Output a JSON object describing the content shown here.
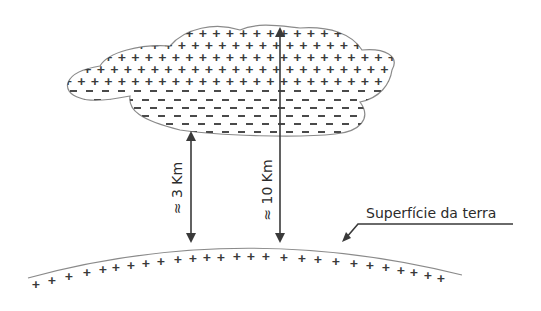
{
  "diagram": {
    "cloud": {
      "upper_charge": "+",
      "lower_charge": "−"
    },
    "ground": {
      "charge": "+",
      "label": "Superfície da terra"
    },
    "arrows": [
      {
        "label": "≈ 3 Km"
      },
      {
        "label": "≈ 10 Km"
      }
    ],
    "colors": {
      "line": "#3a3a3a",
      "outline": "#8a8a8a",
      "background": "#ffffff"
    }
  }
}
